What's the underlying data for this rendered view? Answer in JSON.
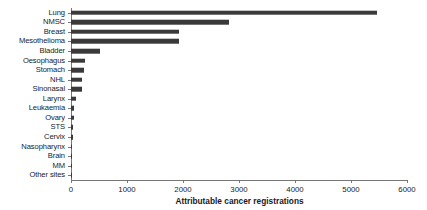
{
  "chart_data": {
    "type": "bar",
    "orientation": "horizontal",
    "title": "",
    "xlabel": "Attributable cancer registrations",
    "ylabel": "",
    "xlim": [
      0,
      6000
    ],
    "xticks": [
      0,
      1000,
      2000,
      3000,
      4000,
      5000,
      6000
    ],
    "xtick_labels": [
      "0",
      "1000",
      "2000",
      "3000",
      "4000",
      "5000",
      "6000"
    ],
    "grid": false,
    "legend": null,
    "bar_color": "#3a3a3a",
    "axis_color": "#777777",
    "categories": [
      "Lung",
      "NMSC",
      "Breast",
      "Mesothelioma",
      "Bladder",
      "Oesophagus",
      "Stomach",
      "NHL",
      "Sinonasal",
      "Larynx",
      "Leukaemia",
      "Ovary",
      "STS",
      "Cervix",
      "Nasopharynx",
      "Brain",
      "MM",
      "Other sites"
    ],
    "values": [
      5470,
      2820,
      1930,
      1930,
      520,
      250,
      230,
      205,
      190,
      90,
      55,
      45,
      40,
      30,
      25,
      20,
      15,
      5
    ]
  }
}
